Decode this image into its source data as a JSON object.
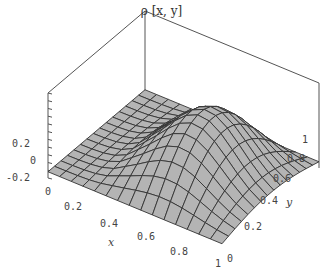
{
  "chart_data": {
    "type": "surface3d",
    "title": "ρ [x, y]",
    "xlabel": "x",
    "ylabel": "y",
    "zlabel": "",
    "x_ticks": [
      "0",
      "0.2",
      "0.4",
      "0.6",
      "0.8",
      "1"
    ],
    "y_ticks": [
      "0",
      "0.2",
      "0.4",
      "0.6",
      "0.8",
      "1"
    ],
    "z_ticks": [
      "-0.2",
      "0",
      "0.2"
    ],
    "xlim": [
      0,
      1
    ],
    "ylim": [
      0,
      1
    ],
    "zlim": [
      -0.25,
      0.35
    ],
    "grid_lines": 15,
    "function_description": "single smooth bump peaking near x≈0.6, y≈0.5, zero along x=0 edge, low flat region for small x",
    "peak_value": 0.3,
    "surface_color": "#b4b4b4",
    "mesh_color": "#333333",
    "box_color": "#555555"
  }
}
